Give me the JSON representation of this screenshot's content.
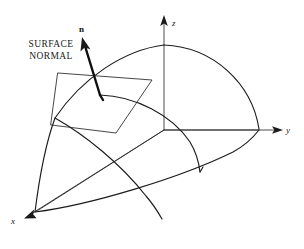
{
  "figure": {
    "background_color": "#ffffff",
    "line_color": "#1c1c1c",
    "axis_color": "#3a3a3a",
    "width": 304,
    "height": 249
  },
  "annotations": {
    "caption_line_1": "SURFACE",
    "caption_line_2": "NORMAL",
    "normal_vector_label": "n"
  },
  "axes": [
    {
      "name": "z-axis",
      "label": "z",
      "direction": "up"
    },
    {
      "name": "y-axis",
      "label": "y",
      "direction": "right"
    },
    {
      "name": "x-axis",
      "label": "x",
      "direction": "lower-left"
    }
  ],
  "geometry": {
    "origin_label": "origin",
    "surface_patch": "spherical-octant-wedge",
    "tangent_plane": "parallelogram",
    "normal_vector": "n",
    "sphere_top_on_z": "pole",
    "sphere_edge_on_y": "equator-point"
  }
}
